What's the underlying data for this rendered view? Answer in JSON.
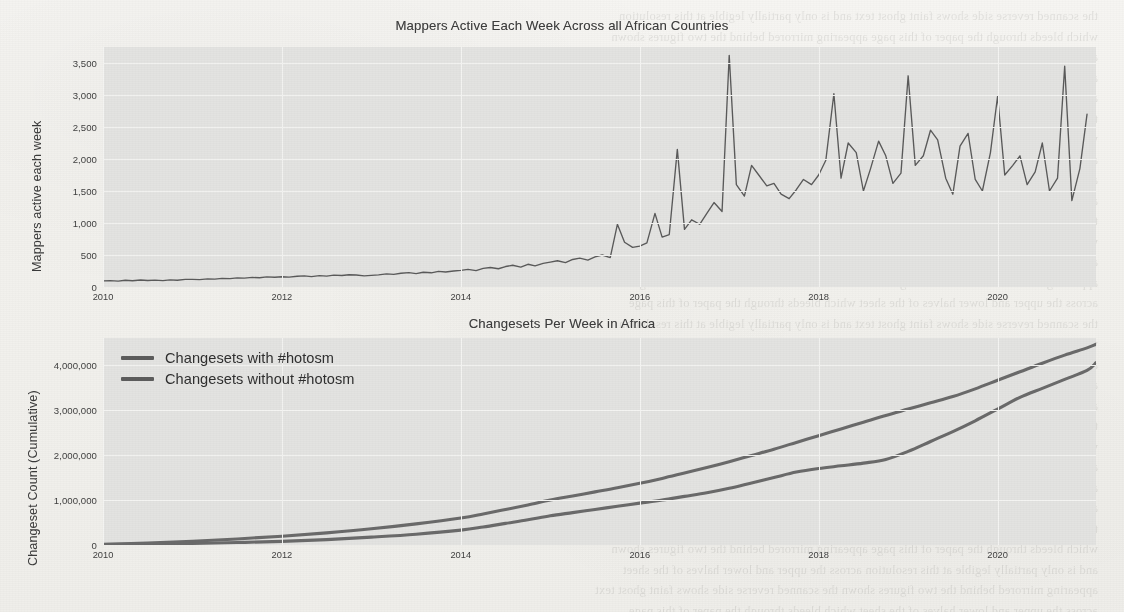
{
  "page": {
    "background_color": "#f2f1ed",
    "plot_background_color": "#e3e3e1",
    "line_color": "#5a5a5a",
    "text_color": "#3d3d3d",
    "bleed_through_lines": [
      "the scanned reverse side shows faint ghost text",
      "which bleeds through the paper of this page",
      "and is only partially legible at this resolution",
      "appearing mirrored behind the two figures shown",
      "across the upper and lower halves of the sheet"
    ]
  },
  "chart_data": [
    {
      "type": "line",
      "title": "Mappers Active Each Week Across all African Countries",
      "xlabel": "",
      "ylabel": "Mappers active each week",
      "xticks": [
        "2010",
        "2012",
        "2014",
        "2016",
        "2018",
        "2020"
      ],
      "xtick_values": [
        2010,
        2012,
        2014,
        2016,
        2018,
        2020
      ],
      "yticks": [
        "0",
        "500",
        "1,000",
        "1,500",
        "2,000",
        "2,500",
        "3,000",
        "3,500"
      ],
      "ytick_values": [
        0,
        500,
        1000,
        1500,
        2000,
        2500,
        3000,
        3500
      ],
      "xlim": [
        2010.0,
        2021.1
      ],
      "ylim": [
        0,
        3750
      ],
      "grid": true,
      "legend": null,
      "series": [
        {
          "name": "Mappers active each week",
          "x": [
            2010.0,
            2010.08,
            2010.17,
            2010.25,
            2010.33,
            2010.42,
            2010.5,
            2010.58,
            2010.67,
            2010.75,
            2010.83,
            2010.92,
            2011.0,
            2011.08,
            2011.17,
            2011.25,
            2011.33,
            2011.42,
            2011.5,
            2011.58,
            2011.67,
            2011.75,
            2011.83,
            2011.92,
            2012.0,
            2012.08,
            2012.17,
            2012.25,
            2012.33,
            2012.42,
            2012.5,
            2012.58,
            2012.67,
            2012.75,
            2012.83,
            2012.92,
            2013.0,
            2013.08,
            2013.17,
            2013.25,
            2013.33,
            2013.42,
            2013.5,
            2013.58,
            2013.67,
            2013.75,
            2013.83,
            2013.92,
            2014.0,
            2014.08,
            2014.17,
            2014.25,
            2014.33,
            2014.42,
            2014.5,
            2014.58,
            2014.67,
            2014.75,
            2014.83,
            2014.92,
            2015.0,
            2015.08,
            2015.17,
            2015.25,
            2015.33,
            2015.42,
            2015.5,
            2015.58,
            2015.67,
            2015.75,
            2015.83,
            2015.92,
            2016.0,
            2016.08,
            2016.17,
            2016.25,
            2016.33,
            2016.42,
            2016.5,
            2016.58,
            2016.67,
            2016.75,
            2016.83,
            2016.92,
            2017.0,
            2017.08,
            2017.17,
            2017.25,
            2017.33,
            2017.42,
            2017.5,
            2017.58,
            2017.67,
            2017.75,
            2017.83,
            2017.92,
            2018.0,
            2018.08,
            2018.17,
            2018.25,
            2018.33,
            2018.42,
            2018.5,
            2018.58,
            2018.67,
            2018.75,
            2018.83,
            2018.92,
            2019.0,
            2019.08,
            2019.17,
            2019.25,
            2019.33,
            2019.42,
            2019.5,
            2019.58,
            2019.67,
            2019.75,
            2019.83,
            2019.92,
            2020.0,
            2020.08,
            2020.17,
            2020.25,
            2020.33,
            2020.42,
            2020.5,
            2020.58,
            2020.67,
            2020.75,
            2020.83,
            2020.92,
            2021.0
          ],
          "y": [
            95,
            100,
            92,
            105,
            98,
            110,
            102,
            108,
            99,
            112,
            105,
            118,
            120,
            115,
            128,
            122,
            135,
            130,
            142,
            138,
            150,
            145,
            158,
            152,
            160,
            155,
            168,
            175,
            162,
            178,
            170,
            185,
            180,
            192,
            188,
            175,
            182,
            190,
            205,
            198,
            215,
            225,
            210,
            230,
            222,
            245,
            235,
            250,
            260,
            275,
            255,
            290,
            305,
            285,
            320,
            340,
            310,
            355,
            330,
            370,
            390,
            410,
            380,
            430,
            450,
            420,
            470,
            500,
            460,
            980,
            700,
            620,
            640,
            690,
            1150,
            780,
            820,
            2150,
            900,
            1050,
            980,
            1150,
            1320,
            1180,
            3620,
            1600,
            1420,
            1900,
            1750,
            1580,
            1620,
            1450,
            1380,
            1520,
            1680,
            1600,
            1750,
            1980,
            3020,
            1700,
            2250,
            2100,
            1500,
            1850,
            2280,
            2050,
            1620,
            1780,
            3300,
            1900,
            2050,
            2450,
            2300,
            1700,
            1450,
            2200,
            2400,
            1680,
            1500,
            2100,
            2980,
            1750,
            1900,
            2050,
            1600,
            1800,
            2250,
            1500,
            1700,
            3450,
            1350,
            1850,
            2700
          ]
        }
      ]
    },
    {
      "type": "line",
      "title": "Changesets Per Week in Africa",
      "xlabel": "",
      "ylabel": "Changeset Count (Cumulative)",
      "xticks": [
        "2010",
        "2012",
        "2014",
        "2016",
        "2018",
        "2020"
      ],
      "xtick_values": [
        2010,
        2012,
        2014,
        2016,
        2018,
        2020
      ],
      "yticks": [
        "0",
        "1,000,000",
        "2,000,000",
        "3,000,000",
        "4,000,000"
      ],
      "ytick_values": [
        0,
        1000000,
        2000000,
        3000000,
        4000000
      ],
      "xlim": [
        2010.0,
        2021.1
      ],
      "ylim": [
        0,
        4600000
      ],
      "grid": true,
      "legend_position": "upper-left",
      "series": [
        {
          "name": "Changesets with #hotosm",
          "x": [
            2010,
            2010.5,
            2011,
            2011.5,
            2012,
            2012.5,
            2013,
            2013.5,
            2014,
            2014.25,
            2014.5,
            2014.75,
            2015,
            2015.25,
            2015.5,
            2015.75,
            2016,
            2016.25,
            2016.5,
            2016.75,
            2017,
            2017.25,
            2017.5,
            2017.75,
            2018,
            2018.25,
            2018.5,
            2018.75,
            2019,
            2019.25,
            2019.5,
            2019.75,
            2020,
            2020.25,
            2020.5,
            2020.75,
            2021,
            2021.1
          ],
          "y": [
            10000,
            20000,
            35000,
            55000,
            80000,
            120000,
            175000,
            240000,
            330000,
            400000,
            480000,
            560000,
            650000,
            720000,
            790000,
            860000,
            930000,
            1000000,
            1080000,
            1160000,
            1260000,
            1380000,
            1500000,
            1620000,
            1700000,
            1760000,
            1820000,
            1900000,
            2080000,
            2300000,
            2520000,
            2760000,
            3020000,
            3280000,
            3480000,
            3680000,
            3880000,
            4050000
          ]
        },
        {
          "name": "Changesets without #hotosm",
          "x": [
            2010,
            2010.5,
            2011,
            2011.5,
            2012,
            2012.5,
            2013,
            2013.5,
            2014,
            2014.25,
            2014.5,
            2014.75,
            2015,
            2015.25,
            2015.5,
            2015.75,
            2016,
            2016.25,
            2016.5,
            2016.75,
            2017,
            2017.25,
            2017.5,
            2017.75,
            2018,
            2018.25,
            2018.5,
            2018.75,
            2019,
            2019.25,
            2019.5,
            2019.75,
            2020,
            2020.25,
            2020.5,
            2020.75,
            2021,
            2021.1
          ],
          "y": [
            15000,
            45000,
            85000,
            135000,
            195000,
            270000,
            360000,
            470000,
            600000,
            690000,
            790000,
            890000,
            1000000,
            1090000,
            1180000,
            1270000,
            1370000,
            1480000,
            1600000,
            1720000,
            1850000,
            1990000,
            2130000,
            2280000,
            2430000,
            2580000,
            2730000,
            2880000,
            3020000,
            3160000,
            3300000,
            3470000,
            3660000,
            3850000,
            4040000,
            4220000,
            4380000,
            4460000
          ]
        }
      ]
    }
  ]
}
